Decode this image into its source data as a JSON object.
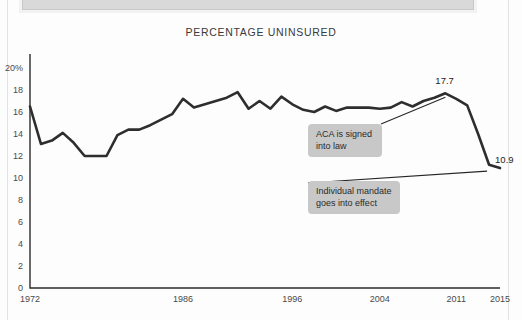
{
  "banner": {
    "name": "top-cropped-banner"
  },
  "chart_data": {
    "type": "line",
    "title": "PERCENTAGE UNINSURED",
    "xlabel": "",
    "ylabel": "",
    "ylim": [
      0,
      20
    ],
    "xlim": [
      1972,
      2015
    ],
    "grid": false,
    "legend": "none",
    "ytick_labels": [
      "20%",
      "18",
      "16",
      "14",
      "12",
      "10",
      "8",
      "6",
      "4",
      "2",
      "0"
    ],
    "ytick_values": [
      20,
      18,
      16,
      14,
      12,
      10,
      8,
      6,
      4,
      2,
      0
    ],
    "xtick_labels": [
      "1972",
      "1986",
      "1996",
      "2004",
      "2011",
      "2015"
    ],
    "xtick_values": [
      1972,
      1986,
      1996,
      2004,
      2011,
      2015
    ],
    "x": [
      1972,
      1973,
      1974,
      1975,
      1976,
      1977,
      1978,
      1979,
      1980,
      1981,
      1982,
      1983,
      1984,
      1985,
      1986,
      1987,
      1988,
      1989,
      1990,
      1991,
      1992,
      1993,
      1994,
      1995,
      1996,
      1997,
      1998,
      1999,
      2000,
      2001,
      2002,
      2003,
      2004,
      2005,
      2006,
      2007,
      2008,
      2009,
      2010,
      2011,
      2012,
      2013,
      2014,
      2015
    ],
    "values": [
      16.5,
      13.1,
      13.4,
      14.1,
      13.2,
      12.0,
      12.0,
      12.0,
      13.9,
      14.4,
      14.4,
      14.8,
      15.3,
      15.8,
      17.2,
      16.4,
      16.7,
      17.0,
      17.3,
      17.8,
      16.3,
      17.0,
      16.3,
      17.4,
      16.7,
      16.2,
      16.0,
      16.5,
      16.1,
      16.4,
      16.4,
      16.4,
      16.3,
      16.4,
      16.9,
      16.5,
      17.0,
      17.3,
      17.7,
      17.2,
      16.6,
      14.0,
      11.2,
      10.9
    ],
    "annotations": [
      {
        "id": "aca",
        "text": "ACA is signed\ninto law",
        "anchor_x": 2010,
        "anchor_y": 17.7
      },
      {
        "id": "mandate",
        "text": "Individual mandate\ngoes into effect",
        "anchor_x": 2014,
        "anchor_y": 10.9
      }
    ],
    "point_labels": [
      {
        "id": "peak",
        "text": "17.7",
        "x": 2010,
        "y": 17.7
      },
      {
        "id": "end",
        "text": "10.9",
        "x": 2014,
        "y": 10.9
      }
    ],
    "colors": {
      "line": "#2e2e2e",
      "axis": "#2b2b2b",
      "callout_bg": "#c8c8c8",
      "text": "#3a3a3a",
      "background": "#fdfdfd"
    }
  }
}
